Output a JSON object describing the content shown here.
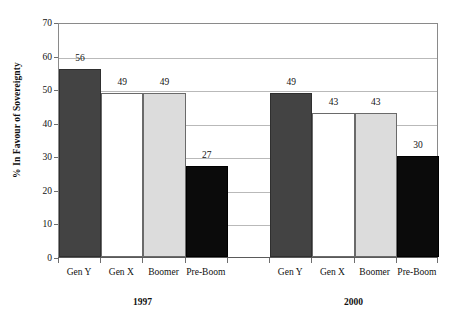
{
  "chart_data": {
    "type": "bar",
    "title": "",
    "subtitle": "",
    "xlabel": "",
    "ylabel": "% In Favour of Sovereignty",
    "ylim": [
      0,
      70
    ],
    "ytick_step": 10,
    "yticks": [
      70,
      60,
      50,
      40,
      30,
      20,
      10,
      0
    ],
    "ytick_labels": [
      "70",
      "60",
      "50",
      "40",
      "30",
      "20",
      "10",
      "0"
    ],
    "grid": true,
    "grid_axis": "y",
    "legend": false,
    "legend_position": "none",
    "categories": [
      "Gen Y",
      "Gen X",
      "Boomer",
      "Pre-Boom"
    ],
    "groups": [
      "1997",
      "2000"
    ],
    "series": [
      {
        "name": "1997",
        "values": [
          56,
          49,
          49,
          27
        ]
      },
      {
        "name": "2000",
        "values": [
          49,
          43,
          43,
          30
        ]
      }
    ],
    "bar_styles": [
      "dark",
      "white",
      "light",
      "black"
    ],
    "bar_colors": {
      "dark": "#434343",
      "white": "#ffffff",
      "light": "#dcdcdc",
      "black": "#0b0b0b"
    },
    "data_labels": [
      {
        "group": "1997",
        "category": "Gen Y",
        "value": 56,
        "text": "56"
      },
      {
        "group": "1997",
        "category": "Gen X",
        "value": 49,
        "text": "49"
      },
      {
        "group": "1997",
        "category": "Boomer",
        "value": 49,
        "text": "49"
      },
      {
        "group": "1997",
        "category": "Pre-Boom",
        "value": 27,
        "text": "27"
      },
      {
        "group": "2000",
        "category": "Gen Y",
        "value": 49,
        "text": "49"
      },
      {
        "group": "2000",
        "category": "Gen X",
        "value": 43,
        "text": "43"
      },
      {
        "group": "2000",
        "category": "Boomer",
        "value": 43,
        "text": "43"
      },
      {
        "group": "2000",
        "category": "Pre-Boom",
        "value": 30,
        "text": "30"
      }
    ],
    "axis_colors": {
      "frame": "#8a8a8a",
      "gridline": "#b9b9b9",
      "baseline": "#5a5a5a",
      "tick": "#6e6e6e",
      "text": "#111111"
    },
    "background": "#ffffff"
  }
}
